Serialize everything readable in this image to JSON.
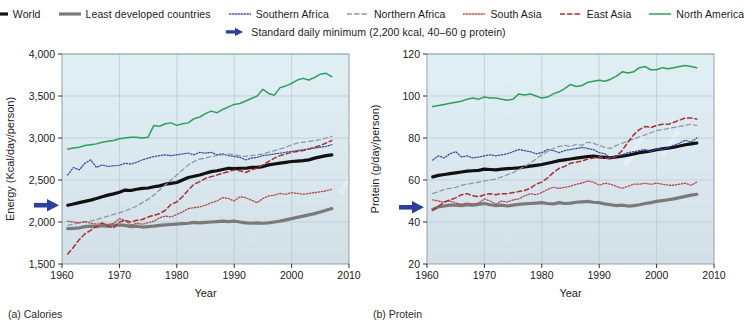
{
  "legend": {
    "rows": [
      [
        {
          "name": "world",
          "label": "World",
          "color": "#111111",
          "style": "solid",
          "width": 3.2
        },
        {
          "name": "least-developed-countries",
          "label": "Least developed countries",
          "color": "#7a7a7a",
          "style": "solid",
          "width": 3.2
        },
        {
          "name": "southern-africa",
          "label": "Southern Africa",
          "color": "#3b4fa0",
          "style": "dotted",
          "width": 1.3
        },
        {
          "name": "northern-africa",
          "label": "Northern Africa",
          "color": "#8d9aa8",
          "style": "dashed",
          "width": 1.3
        },
        {
          "name": "south-asia",
          "label": "South Asia",
          "color": "#b4494b",
          "style": "dotted",
          "width": 1.3
        },
        {
          "name": "east-asia",
          "label": "East Asia",
          "color": "#a8322f",
          "style": "dashed",
          "width": 1.5
        },
        {
          "name": "north-america",
          "label": "North America",
          "color": "#2f9e5f",
          "style": "solid",
          "width": 1.5
        }
      ]
    ],
    "marker_note": {
      "name": "standard-daily-minimum",
      "label": "Standard daily minimum (2,200 kcal, 40–60 g protein)",
      "color": "#2b3f9e"
    }
  },
  "chart_data": [
    {
      "type": "line",
      "name": "calories",
      "caption": "(a) Calories",
      "title": "",
      "xlabel": "Year",
      "ylabel": "Energy (Kcal/day/person)",
      "xlim": [
        1960,
        2010
      ],
      "ylim": [
        1500,
        4000
      ],
      "xticks": [
        1960,
        1970,
        1980,
        1990,
        2000,
        2010
      ],
      "yticks": [
        1500,
        2000,
        2500,
        3000,
        3500,
        4000
      ],
      "ytick_labels": [
        "1,500",
        "2,000",
        "2,500",
        "3,000",
        "3,500",
        "4,000"
      ],
      "grid": true,
      "legend_position": "above-figure",
      "reference_marker": {
        "label": "Standard daily minimum",
        "value": 2200,
        "color": "#2b3f9e"
      },
      "x": [
        1961,
        1962,
        1963,
        1964,
        1965,
        1966,
        1967,
        1968,
        1969,
        1970,
        1971,
        1972,
        1973,
        1974,
        1975,
        1976,
        1977,
        1978,
        1979,
        1980,
        1981,
        1982,
        1983,
        1984,
        1985,
        1986,
        1987,
        1988,
        1989,
        1990,
        1991,
        1992,
        1993,
        1994,
        1995,
        1996,
        1997,
        1998,
        1999,
        2000,
        2001,
        2002,
        2003,
        2004,
        2005,
        2006,
        2007
      ],
      "series": [
        {
          "name": "World",
          "color": "#111111",
          "style": "solid",
          "width": 3.2,
          "values": [
            2200,
            2215,
            2230,
            2245,
            2260,
            2280,
            2300,
            2320,
            2335,
            2355,
            2380,
            2375,
            2390,
            2400,
            2405,
            2420,
            2430,
            2450,
            2460,
            2470,
            2500,
            2530,
            2545,
            2560,
            2580,
            2600,
            2610,
            2625,
            2640,
            2635,
            2640,
            2640,
            2650,
            2650,
            2660,
            2680,
            2690,
            2700,
            2710,
            2720,
            2725,
            2730,
            2740,
            2760,
            2775,
            2790,
            2800
          ]
        },
        {
          "name": "Least developed countries",
          "color": "#7a7a7a",
          "style": "solid",
          "width": 3.2,
          "values": [
            1920,
            1925,
            1930,
            1945,
            1950,
            1945,
            1955,
            1950,
            1960,
            1965,
            1960,
            1945,
            1950,
            1940,
            1945,
            1950,
            1960,
            1965,
            1970,
            1975,
            1980,
            1985,
            1995,
            1990,
            1995,
            2000,
            2005,
            2010,
            2005,
            2010,
            2000,
            1990,
            1985,
            1990,
            1985,
            1990,
            2000,
            2010,
            2025,
            2040,
            2055,
            2070,
            2085,
            2100,
            2120,
            2140,
            2160
          ]
        },
        {
          "name": "Southern Africa",
          "color": "#3b4fa0",
          "style": "dotted",
          "width": 1.3,
          "values": [
            2560,
            2650,
            2620,
            2700,
            2740,
            2650,
            2680,
            2660,
            2670,
            2675,
            2700,
            2690,
            2710,
            2740,
            2760,
            2780,
            2790,
            2800,
            2790,
            2800,
            2810,
            2820,
            2800,
            2830,
            2820,
            2830,
            2800,
            2810,
            2790,
            2780,
            2770,
            2740,
            2760,
            2770,
            2790,
            2800,
            2810,
            2820,
            2830,
            2840,
            2850,
            2860,
            2870,
            2880,
            2890,
            2900,
            2920
          ]
        },
        {
          "name": "Northern Africa",
          "color": "#8d9aa8",
          "style": "dashed",
          "width": 1.3,
          "values": [
            1960,
            1975,
            1990,
            2000,
            2010,
            2030,
            2050,
            2070,
            2090,
            2110,
            2130,
            2160,
            2190,
            2230,
            2270,
            2320,
            2380,
            2440,
            2500,
            2560,
            2620,
            2680,
            2720,
            2750,
            2760,
            2780,
            2790,
            2800,
            2810,
            2800,
            2790,
            2780,
            2790,
            2800,
            2810,
            2830,
            2850,
            2870,
            2890,
            2920,
            2940,
            2950,
            2960,
            2970,
            2980,
            3000,
            3020
          ]
        },
        {
          "name": "South Asia",
          "color": "#b4494b",
          "style": "dotted",
          "width": 1.3,
          "values": [
            2010,
            2000,
            1990,
            2005,
            1985,
            1975,
            1980,
            1970,
            1985,
            2040,
            2020,
            1960,
            1985,
            1975,
            1990,
            2010,
            2050,
            2070,
            2060,
            2090,
            2120,
            2160,
            2170,
            2180,
            2200,
            2230,
            2250,
            2290,
            2280,
            2250,
            2300,
            2290,
            2260,
            2230,
            2280,
            2310,
            2320,
            2340,
            2330,
            2350,
            2340,
            2330,
            2340,
            2350,
            2360,
            2370,
            2390
          ]
        },
        {
          "name": "East Asia",
          "color": "#a8322f",
          "style": "dashed",
          "width": 1.5,
          "values": [
            1620,
            1700,
            1790,
            1860,
            1900,
            1950,
            1990,
            1950,
            1930,
            2000,
            2020,
            2000,
            2020,
            2030,
            2060,
            2080,
            2100,
            2140,
            2210,
            2240,
            2300,
            2380,
            2450,
            2480,
            2520,
            2540,
            2560,
            2580,
            2600,
            2620,
            2610,
            2590,
            2620,
            2640,
            2680,
            2720,
            2760,
            2790,
            2810,
            2830,
            2840,
            2850,
            2870,
            2890,
            2910,
            2940,
            2970
          ]
        },
        {
          "name": "North America",
          "color": "#2f9e5f",
          "style": "solid",
          "width": 1.5,
          "values": [
            2870,
            2880,
            2890,
            2910,
            2920,
            2930,
            2950,
            2960,
            2970,
            2990,
            3000,
            3010,
            3010,
            3000,
            3010,
            3150,
            3140,
            3170,
            3180,
            3150,
            3170,
            3180,
            3230,
            3250,
            3290,
            3320,
            3300,
            3340,
            3370,
            3400,
            3410,
            3440,
            3470,
            3500,
            3580,
            3530,
            3510,
            3600,
            3620,
            3650,
            3690,
            3710,
            3690,
            3720,
            3760,
            3770,
            3730
          ]
        }
      ]
    },
    {
      "type": "line",
      "name": "protein",
      "caption": "(b) Protein",
      "title": "",
      "xlabel": "Year",
      "ylabel": "Protein (g/day/person)",
      "xlim": [
        1960,
        2010
      ],
      "ylim": [
        20,
        120
      ],
      "xticks": [
        1960,
        1970,
        1980,
        1990,
        2000,
        2010
      ],
      "yticks": [
        20,
        40,
        60,
        80,
        100,
        120
      ],
      "ytick_labels": [
        "20",
        "40",
        "60",
        "80",
        "100",
        "120"
      ],
      "grid": true,
      "legend_position": "above-figure",
      "reference_marker": {
        "label": "Standard daily minimum",
        "value": 47,
        "color": "#2b3f9e"
      },
      "x": [
        1961,
        1962,
        1963,
        1964,
        1965,
        1966,
        1967,
        1968,
        1969,
        1970,
        1971,
        1972,
        1973,
        1974,
        1975,
        1976,
        1977,
        1978,
        1979,
        1980,
        1981,
        1982,
        1983,
        1984,
        1985,
        1986,
        1987,
        1988,
        1989,
        1990,
        1991,
        1992,
        1993,
        1994,
        1995,
        1996,
        1997,
        1998,
        1999,
        2000,
        2001,
        2002,
        2003,
        2004,
        2005,
        2006,
        2007
      ],
      "series": [
        {
          "name": "World",
          "color": "#111111",
          "style": "solid",
          "width": 3.2,
          "values": [
            61.5,
            62.2,
            62.6,
            63.0,
            63.4,
            63.8,
            64.2,
            64.4,
            64.6,
            65.2,
            65.0,
            64.8,
            65.2,
            65.4,
            65.6,
            65.8,
            66.2,
            66.6,
            67.0,
            67.4,
            68.0,
            68.6,
            69.2,
            69.6,
            70.0,
            70.4,
            70.8,
            71.2,
            71.4,
            71.0,
            70.8,
            70.6,
            71.0,
            71.4,
            71.8,
            72.4,
            73.0,
            73.4,
            73.8,
            74.4,
            74.8,
            75.2,
            75.6,
            76.2,
            76.8,
            77.2,
            77.6
          ]
        },
        {
          "name": "Least developed countries",
          "color": "#7a7a7a",
          "style": "solid",
          "width": 3.2,
          "values": [
            46.0,
            47.2,
            47.6,
            48.0,
            48.0,
            47.8,
            48.2,
            48.0,
            48.4,
            48.8,
            48.2,
            47.8,
            48.0,
            47.6,
            48.0,
            48.4,
            48.6,
            48.8,
            49.0,
            49.2,
            48.8,
            48.6,
            49.2,
            48.8,
            49.0,
            49.4,
            49.6,
            49.8,
            49.4,
            49.2,
            48.6,
            48.2,
            47.8,
            48.0,
            47.6,
            47.8,
            48.2,
            48.8,
            49.2,
            49.8,
            50.2,
            50.6,
            51.0,
            51.6,
            52.2,
            52.8,
            53.2
          ]
        },
        {
          "name": "Southern Africa",
          "color": "#3b4fa0",
          "style": "dotted",
          "width": 1.3,
          "values": [
            69.5,
            71.5,
            70.5,
            72.5,
            73.5,
            71.0,
            71.5,
            70.5,
            71.0,
            71.5,
            72.0,
            71.5,
            72.0,
            72.5,
            73.5,
            74.5,
            74.0,
            73.5,
            72.5,
            73.0,
            74.5,
            74.0,
            73.0,
            74.0,
            74.5,
            75.0,
            75.5,
            75.0,
            74.5,
            73.0,
            72.5,
            70.5,
            71.5,
            72.0,
            73.0,
            73.5,
            74.0,
            74.5,
            73.5,
            75.0,
            74.5,
            75.5,
            76.5,
            77.5,
            79.0,
            78.0,
            80.0
          ]
        },
        {
          "name": "Northern Africa",
          "color": "#8d9aa8",
          "style": "dashed",
          "width": 1.3,
          "values": [
            53.5,
            54.5,
            55.5,
            56.0,
            56.5,
            57.5,
            58.0,
            58.5,
            59.0,
            59.5,
            60.0,
            60.5,
            61.5,
            62.5,
            63.5,
            65.0,
            66.5,
            68.0,
            70.0,
            72.0,
            73.5,
            75.0,
            76.0,
            76.5,
            76.0,
            77.0,
            76.5,
            78.0,
            77.5,
            76.5,
            75.5,
            75.0,
            76.5,
            77.5,
            78.5,
            79.5,
            80.5,
            81.5,
            82.5,
            83.5,
            84.0,
            84.5,
            85.0,
            85.5,
            86.0,
            86.5,
            86.0
          ]
        },
        {
          "name": "South Asia",
          "color": "#b4494b",
          "style": "dotted",
          "width": 1.3,
          "values": [
            50.5,
            50.0,
            49.5,
            50.0,
            49.0,
            48.5,
            49.0,
            48.5,
            49.0,
            51.0,
            50.0,
            48.5,
            50.0,
            49.5,
            50.5,
            51.0,
            52.5,
            53.5,
            53.0,
            54.0,
            55.5,
            56.5,
            56.0,
            56.5,
            57.0,
            58.0,
            58.5,
            59.5,
            59.0,
            57.5,
            58.5,
            58.0,
            57.0,
            56.0,
            57.0,
            58.0,
            58.0,
            58.5,
            58.0,
            58.5,
            58.0,
            57.5,
            57.5,
            58.0,
            58.5,
            57.5,
            59.0
          ]
        },
        {
          "name": "East Asia",
          "color": "#a8322f",
          "style": "dashed",
          "width": 1.5,
          "values": [
            45.5,
            47.5,
            49.5,
            50.5,
            51.5,
            53.0,
            53.5,
            52.5,
            52.0,
            53.0,
            53.5,
            53.0,
            53.5,
            53.5,
            54.0,
            54.5,
            55.0,
            56.0,
            58.0,
            59.0,
            61.0,
            63.5,
            65.5,
            66.5,
            68.0,
            68.5,
            69.0,
            70.0,
            70.5,
            71.0,
            70.5,
            70.0,
            71.5,
            74.0,
            78.0,
            81.5,
            84.0,
            85.5,
            85.0,
            86.0,
            86.5,
            86.5,
            87.5,
            88.5,
            89.5,
            89.5,
            89.0
          ]
        },
        {
          "name": "North America",
          "color": "#2f9e5f",
          "style": "solid",
          "width": 1.5,
          "values": [
            95.0,
            95.5,
            96.0,
            96.5,
            97.0,
            97.5,
            98.5,
            99.0,
            98.5,
            99.5,
            99.0,
            99.0,
            98.5,
            98.0,
            98.5,
            101.0,
            100.5,
            101.0,
            100.0,
            99.0,
            99.5,
            101.0,
            102.0,
            103.5,
            105.5,
            104.5,
            105.0,
            106.5,
            107.0,
            107.5,
            107.0,
            108.0,
            109.5,
            111.5,
            111.0,
            111.5,
            113.5,
            114.0,
            112.5,
            112.5,
            113.5,
            113.0,
            113.5,
            114.0,
            114.5,
            114.0,
            113.5
          ]
        }
      ]
    }
  ]
}
